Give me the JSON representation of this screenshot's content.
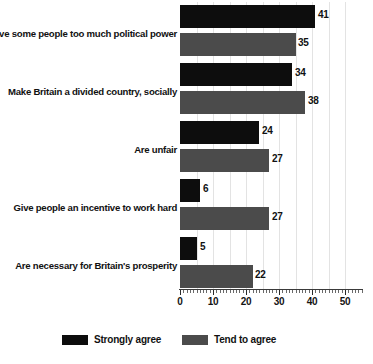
{
  "chart_data": {
    "type": "bar",
    "orientation": "horizontal",
    "title": "",
    "xlabel": "",
    "ylabel": "",
    "xlim": [
      0,
      55
    ],
    "xticks": [
      0,
      10,
      20,
      30,
      40,
      50
    ],
    "xtick_labels": [
      "0",
      "10",
      "20",
      "30",
      "40",
      "50"
    ],
    "grid": true,
    "gridlines_at": [
      5,
      10,
      15,
      20,
      25,
      30,
      35,
      40,
      45,
      50
    ],
    "legend_position": "bottom",
    "categories": [
      "Give some people too much political power",
      "Make Britain a divided country, socially",
      "Are unfair",
      "Give people an incentive to work hard",
      "Are necessary for Britain's prosperity"
    ],
    "series": [
      {
        "name": "Strongly agree",
        "color": "#0d0d0d",
        "values": [
          41,
          34,
          24,
          6,
          5
        ],
        "value_labels": [
          "41",
          "34",
          "24",
          "6",
          "5"
        ]
      },
      {
        "name": "Tend to agree",
        "color": "#4b4b4b",
        "values": [
          35,
          38,
          27,
          27,
          22
        ],
        "value_labels": [
          "35",
          "38",
          "27",
          "27",
          "22"
        ]
      }
    ]
  },
  "legend": {
    "items": [
      {
        "label": "Strongly agree",
        "color": "#0d0d0d"
      },
      {
        "label": "Tend to agree",
        "color": "#4b4b4b"
      }
    ]
  },
  "axis": {
    "tick_labels": [
      "0",
      "10",
      "20",
      "30",
      "40",
      "50"
    ]
  }
}
